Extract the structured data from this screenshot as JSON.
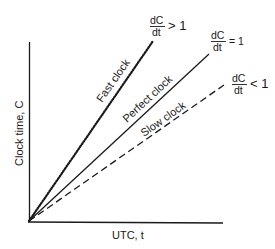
{
  "diagram": {
    "type": "clock-drift-rates",
    "axes": {
      "x_label": "UTC, t",
      "y_label": "Clock time, C"
    },
    "lines": [
      {
        "name": "Fast clock",
        "style": "dotted",
        "condition": {
          "numerator": "dC",
          "denominator": "dt",
          "relation": "> 1"
        }
      },
      {
        "name": "Perfect clock",
        "style": "solid",
        "condition": {
          "numerator": "dC",
          "denominator": "dt",
          "relation": "= 1"
        }
      },
      {
        "name": "Slow clock",
        "style": "dashed",
        "condition": {
          "numerator": "dC",
          "denominator": "dt",
          "relation": "< 1"
        }
      }
    ],
    "colors": {
      "ink": "#1a1a1a",
      "background": "#ffffff"
    }
  }
}
